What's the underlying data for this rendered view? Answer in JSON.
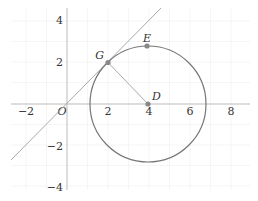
{
  "figure": {
    "type": "coordinate-geometry-diagram",
    "x_ticks": [
      {
        "value": -2,
        "label": "−2"
      },
      {
        "value": 2,
        "label": "2"
      },
      {
        "value": 4,
        "label": "4"
      },
      {
        "value": 6,
        "label": "6"
      },
      {
        "value": 8,
        "label": "8"
      }
    ],
    "y_ticks": [
      {
        "value": 4,
        "label": "4"
      },
      {
        "value": 2,
        "label": "2"
      },
      {
        "value": -2,
        "label": "−2"
      },
      {
        "value": -4,
        "label": "−4"
      }
    ],
    "origin_label": "O",
    "points": {
      "G": {
        "label": "G",
        "x": 2,
        "y": 2
      },
      "E": {
        "label": "E",
        "x": 4,
        "y": 2.83
      },
      "D": {
        "label": "D",
        "x": 4,
        "y": 0
      }
    },
    "circle": {
      "center": "D",
      "radius": 2.83
    },
    "line": {
      "equation": "y = x",
      "through": [
        "O",
        "G"
      ]
    },
    "segment": [
      "G",
      "D"
    ],
    "colors": {
      "axis": "#bbbbbb",
      "grid": "#eeeeee",
      "circle": "#777777",
      "line": "#aaaaaa",
      "point": "#888888",
      "text": "#333333"
    }
  }
}
